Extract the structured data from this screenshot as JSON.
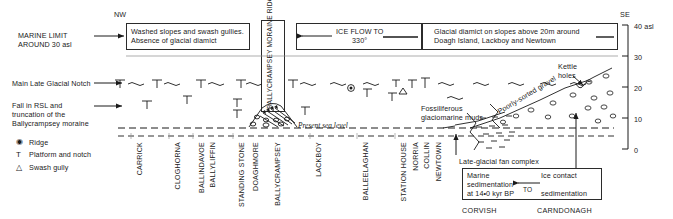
{
  "figure": {
    "type": "geological-cross-section",
    "orientation_left": "NW",
    "orientation_right": "SE",
    "present_sea_level_label": "Present sea level"
  },
  "axis": {
    "unit_label": "40 asl",
    "ticks": [
      "40 asl",
      "30",
      "20",
      "10",
      "0"
    ],
    "values": [
      40,
      30,
      20,
      10,
      0
    ],
    "range": [
      0,
      40
    ]
  },
  "left_annotations": [
    {
      "name": "marine-limit",
      "lines": [
        "MARINE LIMIT",
        "AROUND 30 asl"
      ]
    },
    {
      "name": "main-late-glacial-notch",
      "lines": [
        "Main Late Glacial Notch"
      ]
    },
    {
      "name": "fall-in-rsl",
      "lines": [
        "Fall in RSL and",
        "truncation of the",
        "Ballycrampsey moraine"
      ]
    }
  ],
  "legend": {
    "items": [
      {
        "symbol": "◉",
        "label": "Ridge",
        "icon": "ridge-icon"
      },
      {
        "symbol": "T",
        "label": "Platform and notch",
        "icon": "platform-notch-icon"
      },
      {
        "symbol": "△",
        "label": "Swash gully",
        "icon": "swash-gully-icon"
      }
    ]
  },
  "top_boxes": [
    {
      "name": "washed-slopes-box",
      "lines": [
        "Washed slopes and swash gullies.",
        "Absence of glacial diamict"
      ]
    },
    {
      "name": "ice-flow-box",
      "lines": [
        "ICE FLOW TO",
        "330°"
      ]
    },
    {
      "name": "glacial-diamict-box",
      "lines": [
        "Glacial diamict on slopes above 20m around",
        "Doagh Island, Lackboy and Newtown"
      ]
    }
  ],
  "moraine_ridge_label": "BALLYCRAMPSEY MORAINE RIDGE",
  "inline_labels": {
    "kettle_holes": [
      "Kettle",
      "holes"
    ],
    "poorly_sorted_gravel": "Poorly-sorted gravel",
    "fossiliferous_muds": [
      "Fossiliferous",
      "glaciomarine muds"
    ],
    "fan_complex": "Late-glacial fan complex"
  },
  "bottom_box": {
    "left_lines": [
      "Marine",
      "sedimentation",
      "at 14•0 kyr BP"
    ],
    "right_lines": [
      "Ice contact",
      "sedimentation"
    ],
    "arrow_label": "TO"
  },
  "place_names": [
    {
      "label": "CARRICK",
      "x": 136
    },
    {
      "label": "CLOGHORNA",
      "x": 174
    },
    {
      "label": "BALLINDAVOE",
      "x": 198
    },
    {
      "label": "BALLYLIFFIN",
      "x": 209
    },
    {
      "label": "STANDING STONE",
      "x": 238
    },
    {
      "label": "DOAGHMORE",
      "x": 252
    },
    {
      "label": "BALLYCRAMPSEY",
      "x": 274
    },
    {
      "label": "LACKBOY",
      "x": 315
    },
    {
      "label": "BALLEELAGHAN",
      "x": 362
    },
    {
      "label": "STATION HOUSE",
      "x": 400
    },
    {
      "label": "NORRIA",
      "x": 412
    },
    {
      "label": "COLLIN",
      "x": 423
    },
    {
      "label": "NEWTOWN",
      "x": 435
    }
  ],
  "region_names": [
    {
      "label": "CORVISH",
      "x": 465
    },
    {
      "label": "CARNDONAGH",
      "x": 545
    }
  ],
  "colors": {
    "ink": "#1a1a1a",
    "line": "#2b2b2b",
    "background": "#ffffff"
  }
}
